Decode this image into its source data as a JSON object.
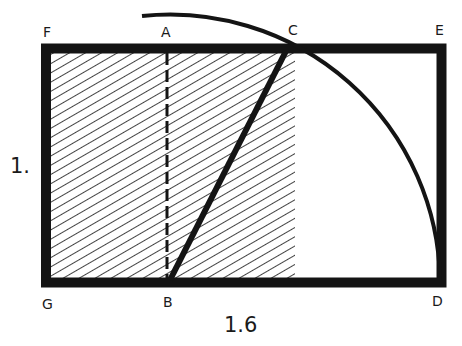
{
  "diagram": {
    "colors": {
      "ink": "#141414",
      "background": "#ffffff"
    },
    "points": {
      "F": "F",
      "A": "A",
      "C": "C",
      "E": "E",
      "G": "G",
      "B": "B",
      "D": "D"
    },
    "dimensions": {
      "height": "1.",
      "width": "1.6"
    },
    "elements": [
      {
        "id": "outer-rectangle",
        "label": "Rectangle GDEF"
      },
      {
        "id": "hatched-square",
        "label": "Square (hatched region)"
      },
      {
        "id": "dashed-line-AB",
        "label": "Midline AB (dashed)"
      },
      {
        "id": "diagonal-BC",
        "label": "Diagonal BC"
      },
      {
        "id": "arc-CD",
        "label": "Arc centered at B from C to D"
      }
    ]
  }
}
